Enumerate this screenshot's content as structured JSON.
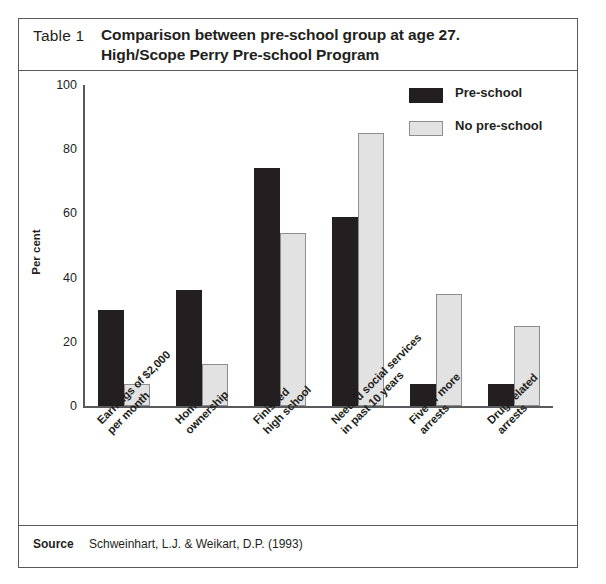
{
  "header": {
    "table_number": "Table 1",
    "title_line1": "Comparison between pre-school group at age 27.",
    "title_line2": "High/Scope Perry Pre-school Program"
  },
  "footer": {
    "source_label": "Source",
    "source_text": "Schweinhart, L.J. & Weikart, D.P. (1993)"
  },
  "colors": {
    "preschool": "#231f20",
    "no_preschool": "#e2e2e2",
    "no_preschool_border": "#8d8e90",
    "axis": "#58595b",
    "frame": "#58595b",
    "text": "#231f20"
  },
  "chart_data": {
    "type": "bar",
    "title": "Comparison between pre-school group at age 27. High/Scope Perry Pre-school Program",
    "xlabel": "",
    "ylabel": "Per cent",
    "ylim": [
      0,
      100
    ],
    "yticks": [
      0,
      20,
      40,
      60,
      80,
      100
    ],
    "ytick_labels": [
      "0",
      "20",
      "40",
      "60",
      "80",
      "100"
    ],
    "grid": false,
    "legend_position": "top-right",
    "categories": [
      "Earnings of $2,000 per month",
      "Home ownership",
      "Finished high school",
      "Needed social services in past 10 years",
      "Five or more arrests",
      "Drug-related arrests"
    ],
    "category_lines": [
      [
        "Earnings of $2,000",
        "per month"
      ],
      [
        "Home",
        "ownership"
      ],
      [
        "Finished",
        "high school"
      ],
      [
        "Needed social services",
        "in past 10 years"
      ],
      [
        "Five or more",
        "arrests"
      ],
      [
        "Drug-related",
        "arrests"
      ]
    ],
    "series": [
      {
        "name": "Pre-school",
        "values": [
          30,
          36,
          74,
          59,
          7,
          7
        ]
      },
      {
        "name": "No pre-school",
        "values": [
          7,
          13,
          54,
          85,
          35,
          25
        ]
      }
    ]
  }
}
